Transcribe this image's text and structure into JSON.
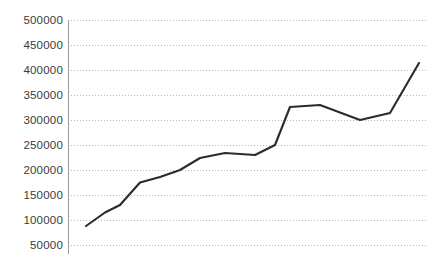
{
  "chart_data": {
    "type": "line",
    "title": "",
    "subtitle": "",
    "xlabel": "",
    "ylabel": "",
    "grid": true,
    "grid_axis": "y",
    "legend": false,
    "legend_position": "none",
    "ylim": [
      50000,
      500000
    ],
    "ytick_labels": [
      "500000",
      "450000",
      "400000",
      "350000",
      "300000",
      "250000",
      "200000",
      "150000",
      "100000",
      "50000"
    ],
    "ytick_values": [
      500000,
      450000,
      400000,
      350000,
      300000,
      250000,
      200000,
      150000,
      100000,
      50000
    ],
    "xtick_labels": [],
    "line_color": "#2b2b2b",
    "grid_color": "#b9b9b9",
    "axis_color": "#9a9a9a",
    "label_color": "#3a3a3a",
    "background_color": "#ffffff",
    "series": [
      {
        "name": "series-1",
        "values": [
          88000,
          115000,
          130000,
          175000,
          186000,
          200000,
          224000,
          234000,
          230000,
          250000,
          326000,
          330000,
          300000,
          314000,
          414000
        ]
      }
    ],
    "x": [
      0,
      1,
      2,
      3,
      4,
      5,
      6,
      7,
      8,
      9,
      10,
      11,
      12,
      13,
      14
    ],
    "x_positions": [
      86,
      105,
      120,
      140,
      160,
      180,
      200,
      225,
      255,
      275,
      290,
      320,
      360,
      390,
      419
    ]
  },
  "layout": {
    "plot_left": 68,
    "plot_right": 428,
    "plot_top": 20,
    "plot_bottom": 245,
    "axis_bottom_overshoot": 254,
    "label_x": 63
  }
}
